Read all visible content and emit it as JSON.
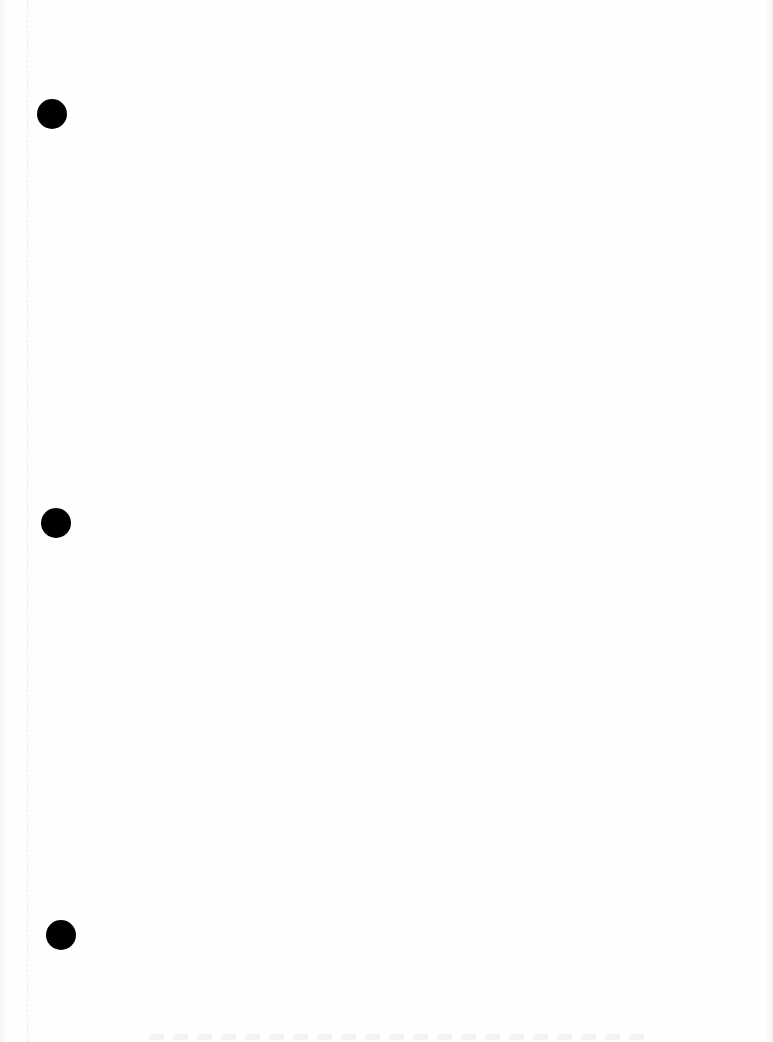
{
  "document": {
    "type": "blank scanned page",
    "text_content": "",
    "punch_holes": [
      {
        "cx": 52,
        "cy": 114,
        "r": 15
      },
      {
        "cx": 56,
        "cy": 523,
        "r": 15
      },
      {
        "cx": 61,
        "cy": 935,
        "r": 15
      }
    ],
    "colors": {
      "paper": "#fefefe",
      "hole": "#000000",
      "margin_line": "#ececec"
    }
  }
}
